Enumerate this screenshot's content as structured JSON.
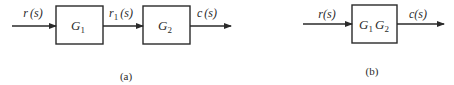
{
  "diagram_a": {
    "caption": "(a)",
    "input_signal": {
      "name": "r",
      "arg": "(s)"
    },
    "block1": {
      "name": "G",
      "sub": "1"
    },
    "intermediate_signal": {
      "name": "r",
      "sub": "1",
      "arg": "(s)"
    },
    "block2": {
      "name": "G",
      "sub": "2"
    },
    "output_signal": {
      "name": "c",
      "arg": "(s)"
    }
  },
  "diagram_b": {
    "caption": "(b)",
    "input_signal": {
      "name": "r",
      "arg": "(s)"
    },
    "block": {
      "name1": "G",
      "sub1": "1",
      "name2": "G",
      "sub2": "2"
    },
    "output_signal": {
      "name": "c",
      "arg": "(s)"
    }
  },
  "colors": {
    "ink": "#2a2a2a",
    "background": "#ffffff"
  }
}
